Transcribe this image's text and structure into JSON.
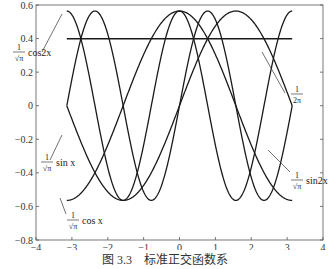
{
  "chart_data": {
    "type": "line",
    "title": "",
    "caption": "图 3.3　标准正交函数系",
    "xlabel": "",
    "ylabel": "",
    "xlim": [
      -4,
      4
    ],
    "ylim": [
      -0.8,
      0.6
    ],
    "xticks": [
      -4,
      -3,
      -2,
      -1,
      0,
      1,
      2,
      3,
      4
    ],
    "yticks": [
      -0.8,
      -0.6,
      -0.4,
      -0.2,
      0,
      0.2,
      0.4,
      0.6
    ],
    "xtick_labels": [
      "−4",
      "−3",
      "−2",
      "−1",
      "0",
      "1",
      "2",
      "3",
      "4"
    ],
    "ytick_labels": [
      "−0.8",
      "−0.6",
      "−0.4",
      "−0.2",
      "0",
      "0.2",
      "0.4",
      "0.6"
    ],
    "grid": false,
    "legend": "none (curves labeled by annotations)",
    "domain": [
      -3.1416,
      3.1416
    ],
    "series": [
      {
        "name": "1/√(2π)",
        "formula": "1/sqrt(2*pi)",
        "constant": 0.3989
      },
      {
        "name": "(1/√π) cos x",
        "formula": "cos(x)/sqrt(pi)",
        "amplitude": 0.5642
      },
      {
        "name": "(1/√π) sin x",
        "formula": "sin(x)/sqrt(pi)",
        "amplitude": 0.5642
      },
      {
        "name": "(1/√π) cos2x",
        "formula": "cos(2x)/sqrt(pi)",
        "amplitude": 0.5642
      },
      {
        "name": "(1/√π) sin2x",
        "formula": "sin(2x)/sqrt(pi)",
        "amplitude": 0.5642
      }
    ],
    "annotations": [
      {
        "label_num": "1",
        "label_den": "√π",
        "label_fn": "cos2x",
        "x": 12,
        "y": 50
      },
      {
        "label_num": "1",
        "label_den": "2π",
        "label_fn": "",
        "x": 290,
        "y": 92
      },
      {
        "label_num": "1",
        "label_den": "√π",
        "label_fn": "sin x",
        "x": 40,
        "y": 160
      },
      {
        "label_num": "1",
        "label_den": "√π",
        "label_fn": "sin2x",
        "x": 290,
        "y": 178
      },
      {
        "label_num": "1",
        "label_den": "√π",
        "label_fn": "cos x",
        "x": 66,
        "y": 218
      }
    ]
  }
}
